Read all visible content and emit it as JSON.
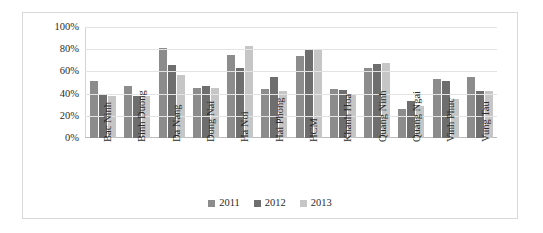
{
  "chart_data": {
    "type": "bar",
    "title": "",
    "xlabel": "",
    "ylabel": "",
    "ylim": [
      0,
      100
    ],
    "yticks": [
      "0%",
      "20%",
      "40%",
      "60%",
      "80%",
      "100%"
    ],
    "ytick_values": [
      0,
      20,
      40,
      60,
      80,
      100
    ],
    "grid": true,
    "legend_position": "bottom-center",
    "categories": [
      "Bac Ninh",
      "Binh Duong",
      "Da Nang",
      "Dong Nai",
      "Ha Noi",
      "Hai Phong",
      "HCM",
      "Khanh Hoa",
      "Quang Ninh",
      "Quang Ngai",
      "Vinh Phuc",
      "Vung Tau"
    ],
    "series": [
      {
        "name": "2011",
        "color": "#8c8c8c",
        "values": [
          51,
          47,
          81,
          45,
          75,
          44,
          74,
          44,
          63,
          26,
          53,
          55
        ]
      },
      {
        "name": "2012",
        "color": "#6e6e6e",
        "values": [
          40,
          38,
          66,
          47,
          63,
          55,
          79,
          43,
          67,
          33,
          51,
          42
        ]
      },
      {
        "name": "2013",
        "color": "#c6c6c6",
        "values": [
          38,
          38,
          57,
          45,
          83,
          42,
          79,
          40,
          68,
          29,
          35,
          42
        ]
      }
    ]
  },
  "legend": {
    "items": [
      {
        "label": "2011",
        "color": "#8c8c8c"
      },
      {
        "label": "2012",
        "color": "#6e6e6e"
      },
      {
        "label": "2013",
        "color": "#c6c6c6"
      }
    ]
  }
}
